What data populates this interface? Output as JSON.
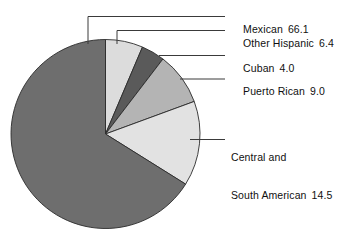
{
  "chart_data": {
    "type": "pie",
    "title": "",
    "subtitle": "",
    "xlabel": "",
    "ylabel": "",
    "legend_position": "callout-labels-right",
    "grid": false,
    "units": "percent",
    "total": 100.0,
    "start_angle_deg": 0,
    "direction": "clockwise",
    "categories": [
      "Other Hispanic",
      "Cuban",
      "Puerto Rican",
      "Central and South American",
      "Mexican"
    ],
    "values": [
      6.4,
      4.0,
      9.0,
      14.5,
      66.1
    ],
    "colors": [
      "#dcdcdc",
      "#5a5a5a",
      "#b4b4b4",
      "#e2e2e2",
      "#6e6e6e"
    ],
    "slices": [
      {
        "label": "Other Hispanic",
        "value": 6.4,
        "value_text": "6.4",
        "color": "#dcdcdc",
        "start_deg": 0.0,
        "sweep_deg": 23.04
      },
      {
        "label": "Cuban",
        "value": 4.0,
        "value_text": "4.0",
        "color": "#5a5a5a",
        "start_deg": 23.04,
        "sweep_deg": 14.4
      },
      {
        "label": "Puerto Rican",
        "value": 9.0,
        "value_text": "9.0",
        "color": "#b4b4b4",
        "start_deg": 37.44,
        "sweep_deg": 32.4
      },
      {
        "label": "Central and South American",
        "value": 14.5,
        "value_text": "14.5",
        "color": "#e2e2e2",
        "start_deg": 69.84,
        "sweep_deg": 52.2
      },
      {
        "label": "Mexican",
        "value": 66.1,
        "value_text": "66.1",
        "color": "#6e6e6e",
        "start_deg": 122.04,
        "sweep_deg": 237.96
      }
    ]
  },
  "callouts": {
    "mexican": {
      "name": "Mexican",
      "value_text": "66.1"
    },
    "other_hispanic": {
      "name": "Other Hispanic",
      "value_text": "6.4"
    },
    "cuban": {
      "name": "Cuban",
      "value_text": "4.0"
    },
    "puerto_rican": {
      "name": "Puerto Rican",
      "value_text": "9.0"
    },
    "central_south_american": {
      "name_line1": "Central and",
      "name_line2": "South American",
      "value_text": "14.5"
    }
  }
}
